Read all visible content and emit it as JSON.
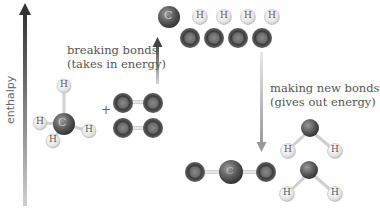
{
  "diagram": {
    "axis": {
      "label": "enthalpy",
      "direction": "up"
    },
    "steps": [
      {
        "label_line1": "breaking bonds",
        "label_line2": "(takes in energy)",
        "arrow": "up"
      },
      {
        "label_line1": "making new bonds",
        "label_line2": "(gives out energy)",
        "arrow": "down"
      }
    ],
    "reactants": {
      "plus_sign": "+",
      "molecules": [
        "CH4",
        "O2",
        "O2"
      ]
    },
    "separated_atoms": {
      "top_row": [
        "C",
        "H",
        "H",
        "H",
        "H"
      ],
      "bottom_row": [
        "O",
        "O",
        "O",
        "O"
      ]
    },
    "products": {
      "molecules": [
        "CO2",
        "H2O",
        "H2O"
      ]
    },
    "atom_symbols": {
      "carbon": "C",
      "hydrogen": "H",
      "oxygen": "O"
    },
    "colors": {
      "carbon_atom": "#5a5a5a",
      "oxygen_atom": "#4a4a4a",
      "hydrogen_atom": "#e6e6e6",
      "bond": "#cfcfcf",
      "axis_arrow_top": "#333333",
      "axis_arrow_bottom": "#cccccc"
    }
  }
}
